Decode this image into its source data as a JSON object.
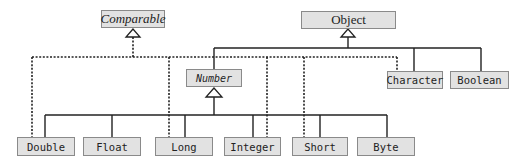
{
  "diagram": {
    "nodes": {
      "comparable": {
        "label": "Comparable",
        "kind": "interface"
      },
      "object": {
        "label": "Object",
        "kind": "class"
      },
      "number": {
        "label": "Number",
        "kind": "abstract-class"
      },
      "character": {
        "label": "Character",
        "kind": "class"
      },
      "boolean": {
        "label": "Boolean",
        "kind": "class"
      },
      "double": {
        "label": "Double",
        "kind": "class"
      },
      "float": {
        "label": "Float",
        "kind": "class"
      },
      "long": {
        "label": "Long",
        "kind": "class"
      },
      "integer": {
        "label": "Integer",
        "kind": "class"
      },
      "short": {
        "label": "Short",
        "kind": "class"
      },
      "byte": {
        "label": "Byte",
        "kind": "class"
      }
    },
    "edges": {
      "inheritance": [
        [
          "Number",
          "Object"
        ],
        [
          "Character",
          "Object"
        ],
        [
          "Boolean",
          "Object"
        ],
        [
          "Double",
          "Number"
        ],
        [
          "Float",
          "Number"
        ],
        [
          "Long",
          "Number"
        ],
        [
          "Integer",
          "Number"
        ],
        [
          "Short",
          "Number"
        ],
        [
          "Byte",
          "Number"
        ]
      ],
      "implements": [
        [
          "Double",
          "Comparable"
        ],
        [
          "Long",
          "Comparable"
        ],
        [
          "Integer",
          "Comparable"
        ],
        [
          "Short",
          "Comparable"
        ],
        [
          "Character",
          "Comparable"
        ]
      ]
    },
    "colors": {
      "box_fill": "#e2e2e2",
      "box_border": "#8a8a8a",
      "line": "#222222"
    }
  }
}
